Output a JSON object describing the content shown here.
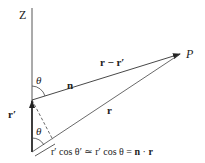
{
  "diagram": {
    "axis_label": "Z",
    "point_label": "P",
    "vectors": {
      "n": "n",
      "r_minus_rprime": "r − r′",
      "r": "r",
      "r_prime": "r′"
    },
    "angles": {
      "theta_top": "θ",
      "theta_bottom": "θ"
    },
    "equation": {
      "part1": "r′ cos θ′ ≃ r′ cos θ = ",
      "n": "n",
      "dot": " · ",
      "r": "r"
    },
    "colors": {
      "line": "#333333",
      "text": "#222222"
    }
  }
}
